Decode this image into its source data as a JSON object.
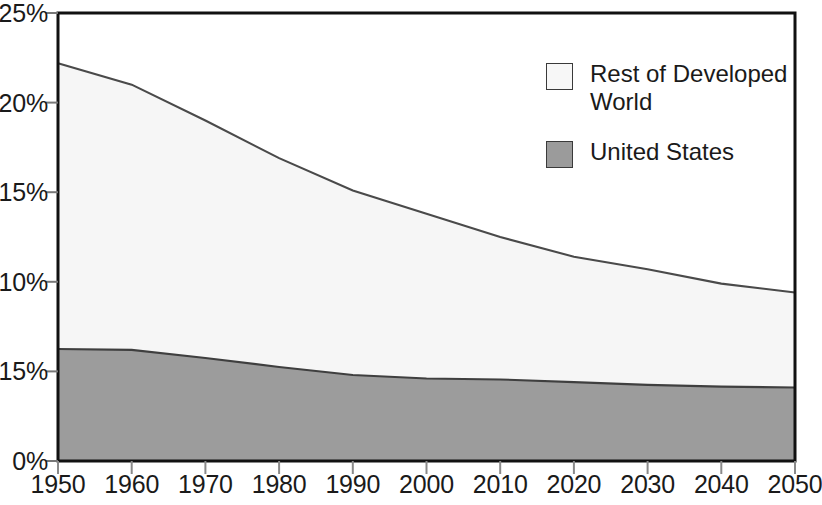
{
  "chart_data": {
    "type": "area",
    "stacked": true,
    "title": "",
    "subtitle": "",
    "xlabel": "",
    "ylabel": "",
    "x": [
      1950,
      1960,
      1970,
      1980,
      1990,
      2000,
      2010,
      2020,
      2030,
      2040,
      2050
    ],
    "xtick_labels": [
      "1950",
      "1960",
      "1970",
      "1980",
      "1990",
      "2000",
      "2010",
      "2020",
      "2030",
      "2040",
      "2050"
    ],
    "xlim": [
      1950,
      2050
    ],
    "ylim": [
      0,
      25
    ],
    "ytick_values": [
      25,
      20,
      15,
      10,
      5,
      0
    ],
    "ytick_labels": [
      "25%",
      "20%",
      "15%",
      "10%",
      "15%",
      "0%"
    ],
    "grid": false,
    "legend_position": "top-right",
    "series": [
      {
        "name": "United States",
        "color": "#9b9b9b",
        "order": "bottom",
        "values": [
          6.25,
          6.2,
          5.75,
          5.25,
          4.8,
          4.6,
          4.55,
          4.4,
          4.25,
          4.15,
          4.1
        ]
      },
      {
        "name": "Rest of Developed World",
        "color": "#f7f7f7",
        "order": "top",
        "values": [
          15.95,
          14.8,
          13.25,
          11.65,
          10.3,
          9.2,
          7.95,
          7.0,
          6.45,
          5.75,
          5.3
        ]
      }
    ],
    "cumulative_top": [
      22.2,
      21.0,
      19.0,
      16.9,
      15.1,
      13.8,
      12.5,
      11.4,
      10.7,
      9.9,
      9.4
    ],
    "line_color": "#4a4a4a",
    "axis_color": "#1a1a1a"
  },
  "legend": {
    "entries": [
      {
        "label": "Rest of Developed World",
        "swatch": "rest-of-developed-world-swatch"
      },
      {
        "label": "United States",
        "swatch": "united-states-swatch"
      }
    ]
  },
  "axes": {
    "y_labels": [
      "25%",
      "20%",
      "15%",
      "10%",
      "15%",
      "0%"
    ],
    "x_labels": [
      "1950",
      "1960",
      "1970",
      "1980",
      "1990",
      "2000",
      "2010",
      "2020",
      "2030",
      "2040",
      "2050"
    ]
  }
}
